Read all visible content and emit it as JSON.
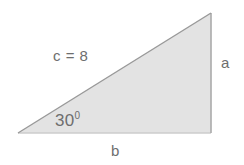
{
  "figure": {
    "type": "right-triangle-diagram",
    "background_color": "#ffffff",
    "width": 244,
    "height": 165
  },
  "shape": {
    "name": "right-triangle",
    "fill_color": "#e3e3e3",
    "hypotenuse_stroke": "#999999",
    "vertical_stroke": "#aaaaaa",
    "base_stroke": "#cccccc",
    "vertices": {
      "bottom_left": [
        18,
        133
      ],
      "apex_right": [
        211,
        13
      ],
      "bottom_right": [
        211,
        133
      ]
    },
    "points_attr": "18,133 211,13 211,133"
  },
  "labels": {
    "hypotenuse": "c = 8",
    "angle_value": "30",
    "angle_degree_symbol": "0",
    "side_opposite": "a",
    "side_adjacent": "b",
    "text_color": "#6e6e6e"
  }
}
